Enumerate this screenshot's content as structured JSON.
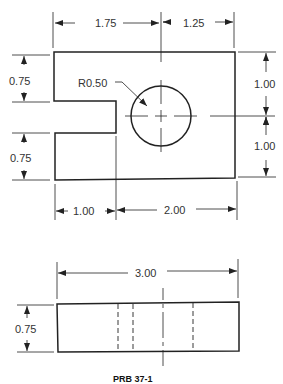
{
  "drawing": {
    "caption": "PRB 37-1",
    "top_view": {
      "dims": {
        "top_left": "1.75",
        "top_right": "1.25",
        "right_upper": "1.00",
        "right_lower": "1.00",
        "left_upper": "0.75",
        "left_lower": "0.75",
        "bottom_left": "1.00",
        "bottom_right": "2.00",
        "radius": "R0.50"
      }
    },
    "front_view": {
      "dims": {
        "width": "3.00",
        "height": "0.75"
      }
    },
    "colors": {
      "line": "#222222",
      "text": "#333333",
      "background": "#ffffff"
    }
  }
}
